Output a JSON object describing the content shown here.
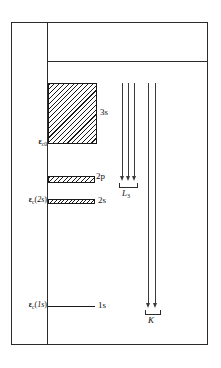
{
  "figure": {
    "type": "energy-level-diagram",
    "background_color": "#ffffff",
    "line_color": "#2b2b2b"
  },
  "levels": [
    {
      "id": "3s",
      "state_label": "3s",
      "energy_label": "",
      "style": "hatched-band",
      "band": true
    },
    {
      "id": "2p",
      "state_label": "2p",
      "energy_label": "",
      "style": "hatched-band",
      "band": true
    },
    {
      "id": "2s",
      "state_label": "2s",
      "energy_label": "",
      "style": "cross-hatched-band",
      "band": true
    },
    {
      "id": "1s",
      "state_label": "1s",
      "energy_label": "",
      "style": "flat-line",
      "band": false
    }
  ],
  "energy_labels": {
    "ec0": {
      "symbol": "ε",
      "subscript": "c0",
      "text": "εc0"
    },
    "ec2s": {
      "symbol": "ε",
      "subscript": "c",
      "argument": "(2s)",
      "text": "εc(2s)"
    },
    "ec1s": {
      "symbol": "ε",
      "subscript": "c",
      "argument": "(1s)",
      "text": "εc(1s)"
    }
  },
  "state_labels": {
    "s3": "3s",
    "p2": "2p",
    "s2": "2s",
    "s1": "1s"
  },
  "transitions": [
    {
      "id": "L3",
      "label": "L",
      "label_subscript": "3",
      "arrow_count": 3,
      "target_level": "2p"
    },
    {
      "id": "K",
      "label": "K",
      "label_subscript": "",
      "arrow_count": 2,
      "target_level": "1s"
    }
  ],
  "chart_data": {
    "type": "diagram",
    "title": "",
    "xlabel": "",
    "ylabel": "",
    "categories": [
      "3s",
      "2p",
      "2s",
      "1s"
    ]
  }
}
